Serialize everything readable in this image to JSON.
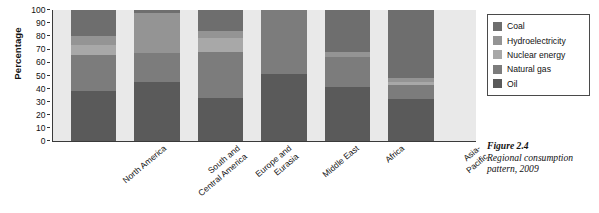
{
  "chart_data": {
    "type": "bar",
    "subtype": "stacked-100-percent",
    "title": "",
    "xlabel": "",
    "ylabel": "Percentage",
    "ylim": [
      0,
      100
    ],
    "yticks": [
      0,
      10,
      20,
      30,
      40,
      50,
      60,
      70,
      80,
      90,
      100
    ],
    "grid": false,
    "legend_position": "right",
    "categories": [
      "North America",
      "South and\nCentral America",
      "Europe and\nEurasia",
      "Middle East",
      "Africa",
      "Asia-Pacific"
    ],
    "series": [
      {
        "name": "Oil",
        "color": "#5a5a5a",
        "values": [
          38,
          45,
          33,
          51,
          41,
          32
        ]
      },
      {
        "name": "Natural gas",
        "color": "#7c7c7c",
        "values": [
          28,
          22,
          35,
          49,
          23,
          11
        ]
      },
      {
        "name": "Nuclear energy",
        "color": "#a8a8a8",
        "values": [
          7,
          0,
          11,
          0,
          0,
          2
        ]
      },
      {
        "name": "Hydroelectricity",
        "color": "#949494",
        "values": [
          7,
          31,
          5,
          0,
          4,
          3
        ]
      },
      {
        "name": "Coal",
        "color": "#6e6e6e",
        "values": [
          20,
          2,
          16,
          0,
          32,
          52
        ]
      }
    ]
  },
  "axis": {
    "y_title": "Percentage",
    "y_ticks": [
      "100",
      "90",
      "80",
      "70",
      "60",
      "50",
      "40",
      "30",
      "20",
      "10",
      "0"
    ]
  },
  "legend": {
    "items": [
      {
        "label": "Coal",
        "color": "#6e6e6e"
      },
      {
        "label": "Hydroelectricity",
        "color": "#949494"
      },
      {
        "label": "Nuclear energy",
        "color": "#a8a8a8"
      },
      {
        "label": "Natural gas",
        "color": "#7c7c7c"
      },
      {
        "label": "Oil",
        "color": "#5a5a5a"
      }
    ]
  },
  "caption": {
    "figure_number": "Figure 2.4",
    "text": "Regional consumption pattern, 2009"
  },
  "colors": {
    "background": "#ffffff",
    "plot_background": "#e9e9e9",
    "axis": "#3a3a3a",
    "text": "#111111"
  }
}
